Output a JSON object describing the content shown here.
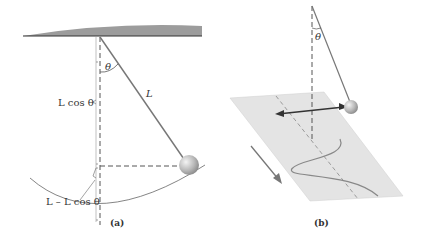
{
  "figure": {
    "panel_a": {
      "caption": "(a)",
      "angle_label": "θ",
      "length_label": "L",
      "vertical_label": "L cos θ",
      "height_label": "L – L cos θ"
    },
    "panel_b": {
      "caption": "(b)",
      "angle_label": "θ"
    },
    "colors": {
      "ceiling": "#9a9a9a",
      "string": "#777777",
      "bob": "#bdbdbd",
      "plane": "#e6e6e6",
      "line": "#555555"
    }
  }
}
